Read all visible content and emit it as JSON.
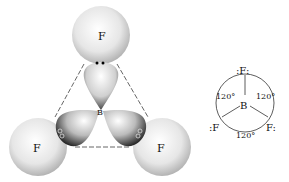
{
  "model": {
    "atoms": [
      {
        "id": "F-top",
        "label": "F"
      },
      {
        "id": "F-left",
        "label": "F"
      },
      {
        "id": "F-right",
        "label": "F"
      },
      {
        "id": "B-center",
        "label": "B"
      }
    ],
    "electron_markers": {
      "top": "••",
      "left": "○○",
      "right": "○○"
    }
  },
  "lewis": {
    "central": "B",
    "top": ":F:",
    "left": ":F",
    "right": "F:",
    "angles": [
      "120°",
      "120°",
      "120°"
    ]
  }
}
